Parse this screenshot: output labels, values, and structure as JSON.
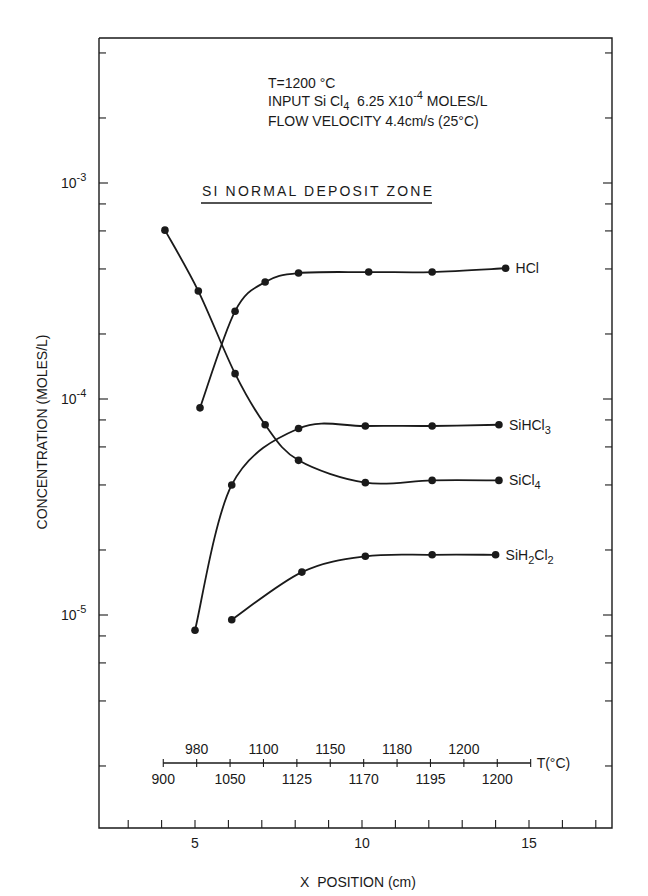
{
  "chart_data": {
    "type": "line",
    "title": "",
    "annotations": {
      "conditions": [
        "T=1200 °C",
        "INPUT Si Cl4  6.25 X 10^-4 MOLES/L",
        "FLOW VELOCITY 4.4cm/s (25°C)"
      ],
      "conditions_parts": {
        "line1": "T=1200 °C",
        "line2_a": "INPUT Si Cl",
        "line2_sub": "4",
        "line2_b": "  6.25 X10",
        "line2_sup": "-4",
        "line2_c": " MOLES/L",
        "line3": "FLOW VELOCITY 4.4cm/s (25°C)"
      },
      "zone_label": "SI NORMAL DEPOSIT ZONE"
    },
    "xlabel": "X  POSITION (cm)",
    "ylabel": "CONCENTRATION  (MOLES/L)",
    "xscale": "linear",
    "yscale": "log",
    "xlim": [
      2.2,
      17.5
    ],
    "ylim": [
      1e-06,
      0.0049
    ],
    "x_ticks_major": [
      5,
      10,
      15
    ],
    "x_ticks_minor": [
      3,
      4,
      6,
      7,
      8,
      9,
      11,
      12,
      13,
      14,
      16,
      17
    ],
    "y_tick_labels": [
      {
        "value": 0.001,
        "base": "10",
        "exp": "-3"
      },
      {
        "value": 0.0001,
        "base": "10",
        "exp": "-4"
      },
      {
        "value": 1e-05,
        "base": "10",
        "exp": "-5"
      }
    ],
    "grid": false,
    "legend": "inline labels at right end of each curve",
    "series": [
      {
        "name": "HCl",
        "label_main": "HCl",
        "label_sub": "",
        "label_rest": "",
        "x": [
          5.15,
          6.2,
          7.1,
          8.1,
          10.2,
          12.1,
          14.3
        ],
        "values": [
          9.1e-05,
          0.000255,
          0.000348,
          0.000383,
          0.000387,
          0.000387,
          0.000403
        ]
      },
      {
        "name": "SiHCl3",
        "label_main": "SiHCl",
        "label_sub": "3",
        "label_rest": "",
        "x": [
          5.0,
          6.1,
          8.1,
          10.1,
          12.1,
          14.1
        ],
        "values": [
          8.5e-06,
          4e-05,
          7.3e-05,
          7.5e-05,
          7.5e-05,
          7.6e-05
        ]
      },
      {
        "name": "SiCl4",
        "label_main": "SiCl",
        "label_sub": "4",
        "label_rest": "",
        "x": [
          4.1,
          5.1,
          6.2,
          7.1,
          8.1,
          10.1,
          12.1,
          14.1
        ],
        "values": [
          0.000605,
          0.000316,
          0.000131,
          7.6e-05,
          5.2e-05,
          4.1e-05,
          4.2e-05,
          4.2e-05
        ]
      },
      {
        "name": "SiH2Cl2",
        "label_main": "SiH",
        "label_sub": "2",
        "label_rest": "Cl",
        "label_sub2": "2",
        "x": [
          6.1,
          8.2,
          10.1,
          12.1,
          14.0
        ],
        "values": [
          9.5e-06,
          1.58e-05,
          1.87e-05,
          1.9e-05,
          1.9e-05
        ]
      }
    ],
    "temperature_scale": {
      "label": "T(°C)",
      "x_start": 4.05,
      "x_end": 15.05,
      "tick_x": [
        4.05,
        5.05,
        6.05,
        7.05,
        8.05,
        9.05,
        10.05,
        11.05,
        12.05,
        13.05,
        14.05,
        15.05
      ],
      "labels_below": [
        {
          "x": 4.05,
          "text": "900"
        },
        {
          "x": 6.05,
          "text": "1050"
        },
        {
          "x": 8.05,
          "text": "1125"
        },
        {
          "x": 10.05,
          "text": "1170"
        },
        {
          "x": 12.05,
          "text": "1195"
        },
        {
          "x": 14.05,
          "text": "1200"
        }
      ],
      "labels_above": [
        {
          "x": 5.05,
          "text": "980"
        },
        {
          "x": 7.05,
          "text": "1100"
        },
        {
          "x": 9.05,
          "text": "1150"
        },
        {
          "x": 11.05,
          "text": "1180"
        },
        {
          "x": 13.05,
          "text": "1200"
        }
      ]
    }
  }
}
